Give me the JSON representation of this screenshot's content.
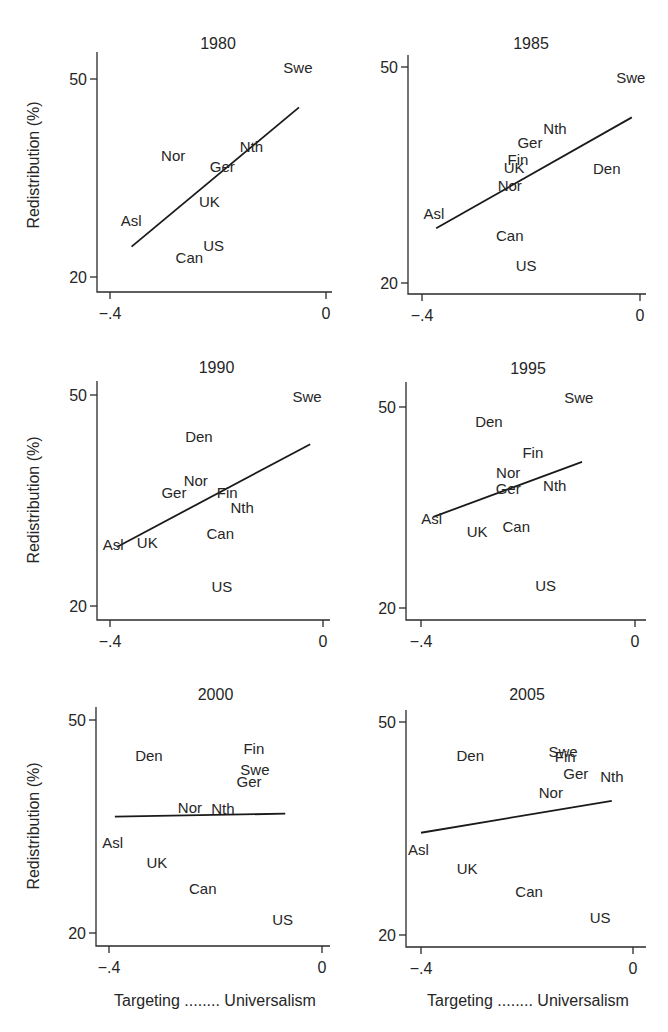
{
  "figure": {
    "ylabel": "Redistribution (%)",
    "xlabel": "Targeting ........ Universalism",
    "line_color": "#1a1a1a",
    "text_color": "#262626"
  },
  "chart_data": [
    {
      "type": "scatter",
      "title": "1980",
      "xlabel": "",
      "ylabel": "Redistribution (%)",
      "xticks": [
        "-.4",
        "0"
      ],
      "yticks": [
        "20",
        "50"
      ],
      "xlim": [
        -0.4,
        0
      ],
      "ylim": [
        20,
        50
      ],
      "grid": false,
      "points": [
        {
          "label": "Swe",
          "x": -0.052,
          "y": 51.7
        },
        {
          "label": "Nth",
          "x": -0.138,
          "y": 39.7
        },
        {
          "label": "Nor",
          "x": -0.283,
          "y": 38.3
        },
        {
          "label": "Ger",
          "x": -0.192,
          "y": 36.7
        },
        {
          "label": "UK",
          "x": -0.216,
          "y": 31.4
        },
        {
          "label": "Asl",
          "x": -0.361,
          "y": 28.5
        },
        {
          "label": "US",
          "x": -0.208,
          "y": 24.7
        },
        {
          "label": "Can",
          "x": -0.253,
          "y": 22.9
        }
      ],
      "fit_line": {
        "x": [
          -0.36,
          -0.05
        ],
        "y": [
          24.6,
          45.7
        ]
      }
    },
    {
      "type": "scatter",
      "title": "1985",
      "xlabel": "",
      "ylabel": "",
      "xticks": [
        "-.4",
        "0"
      ],
      "yticks": [
        "20",
        "50"
      ],
      "xlim": [
        -0.4,
        0
      ],
      "ylim": [
        20,
        50
      ],
      "grid": false,
      "points": [
        {
          "label": "Swe",
          "x": -0.017,
          "y": 48.5
        },
        {
          "label": "Nth",
          "x": -0.156,
          "y": 41.4
        },
        {
          "label": "Ger",
          "x": -0.202,
          "y": 39.4
        },
        {
          "label": "Fin",
          "x": -0.224,
          "y": 37.1
        },
        {
          "label": "UK",
          "x": -0.231,
          "y": 36.0
        },
        {
          "label": "Den",
          "x": -0.061,
          "y": 35.8
        },
        {
          "label": "Nor",
          "x": -0.239,
          "y": 33.5
        },
        {
          "label": "Asl",
          "x": -0.378,
          "y": 29.6
        },
        {
          "label": "Can",
          "x": -0.239,
          "y": 26.5
        },
        {
          "label": "US",
          "x": -0.209,
          "y": 22.4
        }
      ],
      "fit_line": {
        "x": [
          -0.374,
          -0.015
        ],
        "y": [
          27.6,
          43.0
        ]
      }
    },
    {
      "type": "scatter",
      "title": "1990",
      "xlabel": "",
      "ylabel": "Redistribution (%)",
      "xticks": [
        "-.4",
        "0"
      ],
      "yticks": [
        "20",
        "50"
      ],
      "xlim": [
        -0.4,
        0
      ],
      "ylim": [
        20,
        50
      ],
      "grid": false,
      "points": [
        {
          "label": "Swe",
          "x": -0.03,
          "y": 49.7
        },
        {
          "label": "Den",
          "x": -0.233,
          "y": 44.0
        },
        {
          "label": "Nor",
          "x": -0.239,
          "y": 37.8
        },
        {
          "label": "Ger",
          "x": -0.28,
          "y": 36.1
        },
        {
          "label": "Fin",
          "x": -0.18,
          "y": 36.1
        },
        {
          "label": "Nth",
          "x": -0.152,
          "y": 33.9
        },
        {
          "label": "Can",
          "x": -0.193,
          "y": 30.2
        },
        {
          "label": "UK",
          "x": -0.33,
          "y": 28.9
        },
        {
          "label": "Asl",
          "x": -0.394,
          "y": 28.7
        },
        {
          "label": "US",
          "x": -0.19,
          "y": 22.7
        }
      ],
      "fit_line": {
        "x": [
          -0.387,
          -0.024
        ],
        "y": [
          28.4,
          43.0
        ]
      }
    },
    {
      "type": "scatter",
      "title": "1995",
      "xlabel": "",
      "ylabel": "",
      "xticks": [
        "-.4",
        "0"
      ],
      "yticks": [
        "20",
        "50"
      ],
      "xlim": [
        -0.4,
        0
      ],
      "ylim": [
        20,
        50
      ],
      "grid": false,
      "points": [
        {
          "label": "Swe",
          "x": -0.105,
          "y": 51.3
        },
        {
          "label": "Den",
          "x": -0.273,
          "y": 47.8
        },
        {
          "label": "Fin",
          "x": -0.191,
          "y": 43.1
        },
        {
          "label": "Nor",
          "x": -0.237,
          "y": 40.1
        },
        {
          "label": "Nth",
          "x": -0.15,
          "y": 38.2
        },
        {
          "label": "Ger",
          "x": -0.237,
          "y": 37.7
        },
        {
          "label": "Asl",
          "x": -0.38,
          "y": 33.3
        },
        {
          "label": "Can",
          "x": -0.222,
          "y": 32.1
        },
        {
          "label": "UK",
          "x": -0.295,
          "y": 31.3
        },
        {
          "label": "US",
          "x": -0.167,
          "y": 23.3
        }
      ],
      "fit_line": {
        "x": [
          -0.377,
          -0.099
        ],
        "y": [
          33.6,
          41.8
        ]
      }
    },
    {
      "type": "scatter",
      "title": "2000",
      "xlabel": "Targeting ........ Universalism",
      "ylabel": "Redistribution (%)",
      "xticks": [
        "-.4",
        "0"
      ],
      "yticks": [
        "20",
        "50"
      ],
      "xlim": [
        -0.4,
        0
      ],
      "ylim": [
        20,
        50
      ],
      "grid": false,
      "points": [
        {
          "label": "Fin",
          "x": -0.128,
          "y": 45.9
        },
        {
          "label": "Den",
          "x": -0.325,
          "y": 44.9
        },
        {
          "label": "Swe",
          "x": -0.126,
          "y": 42.9
        },
        {
          "label": "Ger",
          "x": -0.137,
          "y": 41.3
        },
        {
          "label": "Nor",
          "x": -0.248,
          "y": 37.6
        },
        {
          "label": "Nth",
          "x": -0.186,
          "y": 37.5
        },
        {
          "label": "Asl",
          "x": -0.393,
          "y": 32.7
        },
        {
          "label": "UK",
          "x": -0.31,
          "y": 29.9
        },
        {
          "label": "Can",
          "x": -0.224,
          "y": 26.2
        },
        {
          "label": "US",
          "x": -0.074,
          "y": 21.8
        }
      ],
      "fit_line": {
        "x": [
          -0.389,
          -0.069
        ],
        "y": [
          36.4,
          36.8
        ]
      }
    },
    {
      "type": "scatter",
      "title": "2005",
      "xlabel": "Targeting ........ Universalism",
      "ylabel": "",
      "xticks": [
        "-.4",
        "0"
      ],
      "yticks": [
        "20",
        "50"
      ],
      "xlim": [
        -0.4,
        0
      ],
      "ylim": [
        20,
        50
      ],
      "grid": false,
      "points": [
        {
          "label": "Swe",
          "x": -0.132,
          "y": 45.8
        },
        {
          "label": "Fin",
          "x": -0.128,
          "y": 45.1
        },
        {
          "label": "Den",
          "x": -0.307,
          "y": 45.2
        },
        {
          "label": "Ger",
          "x": -0.108,
          "y": 42.7
        },
        {
          "label": "Nth",
          "x": -0.04,
          "y": 42.3
        },
        {
          "label": "Nor",
          "x": -0.155,
          "y": 40.0
        },
        {
          "label": "Asl",
          "x": -0.405,
          "y": 32.0
        },
        {
          "label": "UK",
          "x": -0.313,
          "y": 29.3
        },
        {
          "label": "Can",
          "x": -0.196,
          "y": 26.1
        },
        {
          "label": "US",
          "x": -0.062,
          "y": 22.4
        }
      ],
      "fit_line": {
        "x": [
          -0.4,
          -0.04
        ],
        "y": [
          34.4,
          38.9
        ]
      }
    }
  ]
}
